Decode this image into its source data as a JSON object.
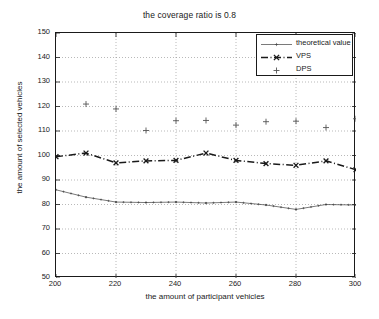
{
  "chart_data": {
    "type": "line",
    "title": "the coverage ratio is 0.8",
    "xlabel": "the amount of participant vehicles",
    "ylabel": "the amount of selected vehicles",
    "xlim": [
      200,
      300
    ],
    "ylim": [
      50,
      150
    ],
    "xticks": [
      200,
      220,
      240,
      260,
      280,
      300
    ],
    "yticks": [
      50,
      60,
      70,
      80,
      90,
      100,
      110,
      120,
      130,
      140,
      150
    ],
    "grid": true,
    "legend_position": "top-right",
    "x": [
      200,
      210,
      220,
      230,
      240,
      250,
      260,
      270,
      280,
      290,
      300
    ],
    "series": [
      {
        "name": "theoretical value",
        "style": "solid-thin",
        "marker": "plus-small",
        "color": "#404040",
        "values": [
          86.0,
          83.0,
          81.0,
          80.8,
          81.0,
          80.6,
          81.0,
          79.8,
          78.0,
          80.0,
          79.8
        ]
      },
      {
        "name": "VPS",
        "style": "dash-dot",
        "marker": "x",
        "color": "#1a1a1a",
        "values": [
          99.5,
          101.0,
          97.0,
          97.8,
          98.0,
          101.0,
          98.0,
          96.7,
          96.0,
          97.8,
          94.2
        ]
      },
      {
        "name": "DPS",
        "style": "none",
        "marker": "plus",
        "color": "#555555",
        "values": [
          null,
          121.0,
          119.0,
          110.2,
          114.2,
          114.3,
          112.4,
          113.8,
          114.0,
          111.4,
          115.0
        ]
      }
    ]
  },
  "axes": {
    "y_tick_labels": [
      "150",
      "140",
      "130",
      "120",
      "110",
      "100",
      "90",
      "80",
      "70",
      "60",
      "50"
    ],
    "x_tick_labels": [
      "200",
      "220",
      "240",
      "260",
      "280",
      "300"
    ]
  },
  "legend": {
    "items": [
      {
        "label": "theoretical value",
        "marker": "plus-small",
        "style": "solid-thin"
      },
      {
        "label": "VPS",
        "marker": "x",
        "style": "dash-dot"
      },
      {
        "label": "DPS",
        "marker": "plus",
        "style": "none"
      }
    ]
  }
}
